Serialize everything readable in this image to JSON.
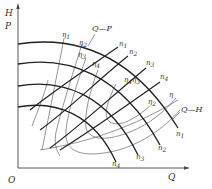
{
  "figure": {
    "axes": {
      "y_label_top": "H",
      "y_label_bottom": "P",
      "x_label": "Q",
      "origin": "O"
    },
    "curve_labels": {
      "qp": "Q—P",
      "qh": "Q—H"
    },
    "qh_curves": [
      {
        "name": "n",
        "sub": "1"
      },
      {
        "name": "n",
        "sub": "2"
      },
      {
        "name": "n",
        "sub": "3"
      },
      {
        "name": "n",
        "sub": "4"
      }
    ],
    "qp_curves": [
      {
        "name": "n",
        "sub": "1"
      },
      {
        "name": "n",
        "sub": "2"
      },
      {
        "name": "n",
        "sub": "3"
      },
      {
        "name": "n",
        "sub": "4"
      }
    ],
    "efficiency_labels": [
      {
        "name": "η",
        "sub": "1"
      },
      {
        "name": "η",
        "sub": "2"
      },
      {
        "name": "η",
        "sub": "3"
      },
      {
        "name": "η",
        "sub": "4"
      },
      {
        "name": "η",
        "sub": "4"
      },
      {
        "name": "η",
        "sub": "3"
      },
      {
        "name": "η",
        "sub": "2"
      },
      {
        "name": "η",
        "sub": ""
      }
    ],
    "colors": {
      "curve": "#222222",
      "efficiency": "#666666",
      "text": "#333333"
    }
  }
}
